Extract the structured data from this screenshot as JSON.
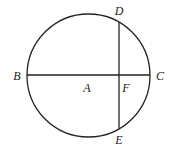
{
  "diagram": {
    "circle": {
      "cx": 88.5,
      "cy": 75.5,
      "r": 61.5,
      "stroke": "#222222"
    },
    "segments": [
      {
        "name": "BC",
        "x1": 27,
        "y1": 75,
        "x2": 150,
        "y2": 75
      },
      {
        "name": "DE",
        "x1": 119,
        "y1": 22,
        "x2": 119,
        "y2": 129
      }
    ],
    "points": [
      {
        "id": "D",
        "label": "D",
        "x": 119,
        "y": 11
      },
      {
        "id": "B",
        "label": "B",
        "x": 17,
        "y": 76
      },
      {
        "id": "C",
        "label": "C",
        "x": 160,
        "y": 76
      },
      {
        "id": "A",
        "label": "A",
        "x": 87,
        "y": 88
      },
      {
        "id": "F",
        "label": "F",
        "x": 126,
        "y": 88
      },
      {
        "id": "E",
        "label": "E",
        "x": 119,
        "y": 140
      }
    ]
  }
}
